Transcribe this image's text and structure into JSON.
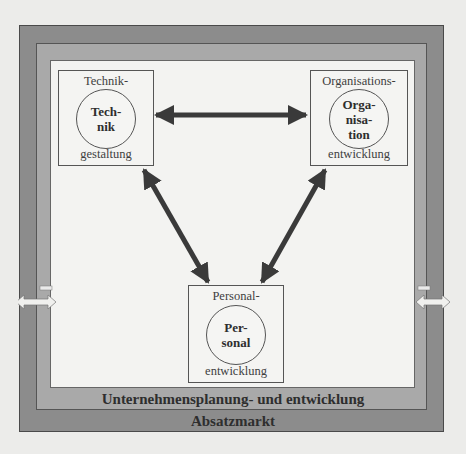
{
  "diagram": {
    "outer_label": "Absatzmarkt",
    "middle_label": "Unternehmensplanung- und entwicklung",
    "nodes": {
      "technik": {
        "top": "Technik-",
        "circle": [
          "Tech-",
          "nik"
        ],
        "bottom": "gestaltung"
      },
      "organisation": {
        "top": "Organisations-",
        "circle": [
          "Orga-",
          "nisa-",
          "tion"
        ],
        "bottom": "entwicklung"
      },
      "personal": {
        "top": "Personal-",
        "circle": [
          "Per-",
          "sonal"
        ],
        "bottom": "entwicklung"
      }
    },
    "connections": [
      {
        "from": "technik",
        "to": "organisation",
        "type": "bidirectional"
      },
      {
        "from": "technik",
        "to": "personal",
        "type": "bidirectional"
      },
      {
        "from": "organisation",
        "to": "personal",
        "type": "bidirectional"
      }
    ],
    "side_arrows": [
      "left-bidirectional",
      "right-bidirectional"
    ],
    "colors": {
      "outer_band": "#8c8c8c",
      "middle_band": "#a9a9a9",
      "inner_area": "#f3f3f1",
      "arrow": "#3a3a3a"
    }
  }
}
